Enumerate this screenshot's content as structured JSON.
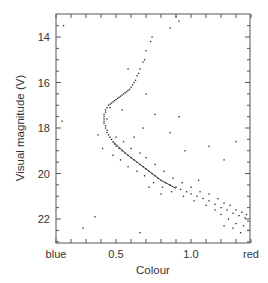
{
  "chart_data": {
    "type": "scatter",
    "title": "",
    "xlabel": "Colour",
    "ylabel": "Visual magnitude (V)",
    "x_tick_labels": [
      "blue",
      "0.5",
      "1.0",
      "red"
    ],
    "x_ticks": [
      0.1,
      0.5,
      1.0,
      1.4
    ],
    "y_tick_labels": [
      "14",
      "16",
      "18",
      "20",
      "22"
    ],
    "y_ticks": [
      14,
      16,
      18,
      20,
      22
    ],
    "xlim": [
      0.1,
      1.4
    ],
    "ylim": [
      23.0,
      13.0
    ],
    "y_inverted": true,
    "grid": false,
    "legend": null,
    "series": [
      {
        "name": "stars",
        "type": "scatter",
        "points": [
          [
            0.9,
            13.1
          ],
          [
            0.92,
            13.3
          ],
          [
            0.86,
            13.6
          ],
          [
            0.74,
            14.0
          ],
          [
            0.73,
            14.2
          ],
          [
            0.7,
            14.6
          ],
          [
            0.69,
            15.0
          ],
          [
            0.68,
            15.1
          ],
          [
            0.66,
            15.4
          ],
          [
            0.65,
            15.6
          ],
          [
            0.64,
            15.7
          ],
          [
            0.63,
            15.9
          ],
          [
            0.62,
            16.0
          ],
          [
            0.61,
            16.1
          ],
          [
            0.6,
            16.2
          ],
          [
            0.59,
            16.3
          ],
          [
            0.58,
            16.35
          ],
          [
            0.57,
            16.4
          ],
          [
            0.56,
            16.45
          ],
          [
            0.55,
            16.5
          ],
          [
            0.54,
            16.55
          ],
          [
            0.53,
            16.6
          ],
          [
            0.52,
            16.65
          ],
          [
            0.51,
            16.7
          ],
          [
            0.5,
            16.75
          ],
          [
            0.49,
            16.8
          ],
          [
            0.48,
            16.85
          ],
          [
            0.47,
            16.9
          ],
          [
            0.46,
            16.95
          ],
          [
            0.45,
            17.0
          ],
          [
            0.44,
            17.1
          ],
          [
            0.43,
            17.2
          ],
          [
            0.43,
            17.3
          ],
          [
            0.42,
            17.4
          ],
          [
            0.42,
            17.5
          ],
          [
            0.42,
            17.6
          ],
          [
            0.42,
            17.7
          ],
          [
            0.42,
            17.8
          ],
          [
            0.43,
            17.9
          ],
          [
            0.43,
            18.0
          ],
          [
            0.44,
            18.1
          ],
          [
            0.44,
            18.2
          ],
          [
            0.45,
            18.3
          ],
          [
            0.46,
            18.4
          ],
          [
            0.47,
            18.5
          ],
          [
            0.48,
            18.6
          ],
          [
            0.49,
            18.7
          ],
          [
            0.5,
            18.8
          ],
          [
            0.52,
            18.9
          ],
          [
            0.54,
            19.0
          ],
          [
            0.56,
            19.1
          ],
          [
            0.58,
            19.2
          ],
          [
            0.6,
            19.3
          ],
          [
            0.62,
            19.4
          ],
          [
            0.64,
            19.5
          ],
          [
            0.66,
            19.6
          ],
          [
            0.68,
            19.7
          ],
          [
            0.7,
            19.8
          ],
          [
            0.72,
            19.9
          ],
          [
            0.74,
            20.0
          ],
          [
            0.76,
            20.1
          ],
          [
            0.78,
            20.2
          ],
          [
            0.8,
            20.3
          ],
          [
            0.83,
            20.4
          ],
          [
            0.86,
            20.5
          ],
          [
            0.9,
            20.6
          ],
          [
            0.93,
            20.7
          ],
          [
            0.97,
            20.8
          ],
          [
            1.0,
            20.9
          ],
          [
            1.04,
            21.0
          ],
          [
            1.08,
            21.1
          ],
          [
            1.12,
            21.2
          ],
          [
            1.16,
            21.35
          ],
          [
            1.2,
            21.5
          ],
          [
            1.24,
            21.6
          ],
          [
            1.28,
            21.75
          ],
          [
            1.32,
            21.85
          ],
          [
            1.36,
            21.95
          ],
          [
            1.38,
            22.1
          ],
          [
            0.46,
            17.1
          ],
          [
            0.44,
            17.6
          ],
          [
            0.5,
            18.4
          ],
          [
            0.55,
            18.6
          ],
          [
            0.6,
            18.9
          ],
          [
            0.66,
            19.1
          ],
          [
            0.7,
            19.3
          ],
          [
            0.76,
            19.6
          ],
          [
            0.82,
            19.9
          ],
          [
            0.88,
            20.2
          ],
          [
            0.94,
            20.4
          ],
          [
            1.0,
            20.6
          ],
          [
            1.06,
            20.8
          ],
          [
            1.12,
            20.9
          ],
          [
            1.18,
            21.1
          ],
          [
            1.22,
            21.3
          ],
          [
            1.26,
            21.4
          ],
          [
            1.3,
            21.6
          ],
          [
            1.34,
            21.7
          ],
          [
            1.37,
            21.8
          ],
          [
            0.38,
            18.3
          ],
          [
            0.41,
            18.9
          ],
          [
            0.48,
            19.2
          ],
          [
            0.53,
            19.4
          ],
          [
            0.58,
            19.7
          ],
          [
            0.64,
            19.9
          ],
          [
            0.69,
            20.1
          ],
          [
            0.75,
            20.4
          ],
          [
            0.81,
            20.6
          ],
          [
            0.87,
            20.8
          ],
          [
            0.95,
            21.0
          ],
          [
            1.02,
            21.2
          ],
          [
            1.1,
            21.4
          ],
          [
            1.16,
            21.6
          ],
          [
            1.2,
            21.8
          ],
          [
            1.25,
            22.0
          ],
          [
            1.3,
            22.2
          ],
          [
            1.35,
            22.3
          ],
          [
            1.38,
            22.5
          ],
          [
            1.33,
            22.6
          ],
          [
            1.22,
            22.3
          ],
          [
            1.28,
            22.4
          ],
          [
            0.7,
            16.5
          ],
          [
            0.76,
            17.4
          ],
          [
            0.68,
            18.0
          ],
          [
            0.62,
            18.4
          ],
          [
            0.86,
            18.2
          ],
          [
            1.12,
            18.8
          ],
          [
            1.22,
            19.4
          ],
          [
            0.96,
            19.0
          ],
          [
            0.8,
            20.9
          ],
          [
            0.28,
            22.4
          ],
          [
            0.36,
            21.9
          ],
          [
            0.66,
            22.6
          ],
          [
            0.15,
            13.5
          ],
          [
            0.14,
            17.7
          ],
          [
            0.58,
            15.4
          ],
          [
            0.72,
            20.6
          ],
          [
            1.05,
            20.3
          ],
          [
            0.92,
            17.5
          ],
          [
            1.3,
            18.6
          ],
          [
            0.54,
            17.2
          ]
        ]
      },
      {
        "name": "isochrone",
        "type": "line",
        "points": [
          [
            0.48,
            18.6
          ],
          [
            0.52,
            18.85
          ],
          [
            0.58,
            19.2
          ],
          [
            0.65,
            19.55
          ],
          [
            0.72,
            19.9
          ],
          [
            0.8,
            20.3
          ],
          [
            0.9,
            20.65
          ]
        ]
      }
    ]
  }
}
